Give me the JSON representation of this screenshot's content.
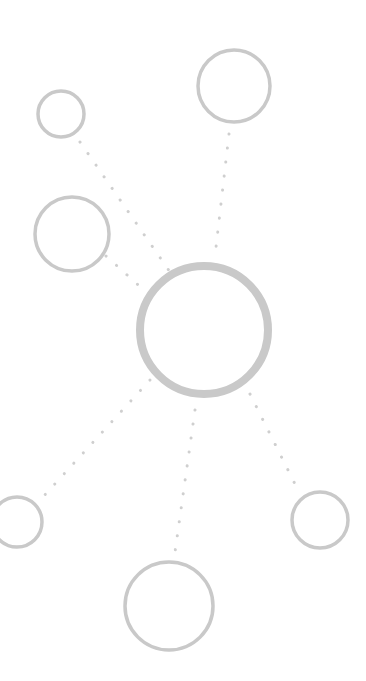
{
  "diagram": {
    "type": "hub-and-spoke network",
    "stroke_color": "#c9c9c9",
    "dot_color": "#cfcfcf",
    "hub": {
      "id": "hub",
      "cx": 204,
      "cy": 330,
      "r": 64,
      "stroke_width": 8
    },
    "nodes": [
      {
        "id": "node-top-right",
        "cx": 234,
        "cy": 86,
        "r": 36,
        "stroke_width": 3.5
      },
      {
        "id": "node-top-left-small",
        "cx": 61,
        "cy": 114,
        "r": 23,
        "stroke_width": 3.5
      },
      {
        "id": "node-left-middle",
        "cx": 72,
        "cy": 234,
        "r": 37,
        "stroke_width": 3.5
      },
      {
        "id": "node-bottom-left",
        "cx": 17,
        "cy": 522,
        "r": 25,
        "stroke_width": 3.5
      },
      {
        "id": "node-bottom-right",
        "cx": 320,
        "cy": 520,
        "r": 28,
        "stroke_width": 3.5
      },
      {
        "id": "node-bottom",
        "cx": 169,
        "cy": 606,
        "r": 44,
        "stroke_width": 3.5
      }
    ],
    "connectors": [
      {
        "id": "link-top-right",
        "x1": 229,
        "y1": 134,
        "x2": 215,
        "y2": 256
      },
      {
        "id": "link-top-left-small",
        "x1": 80,
        "y1": 142,
        "x2": 170,
        "y2": 272
      },
      {
        "id": "link-left-middle",
        "x1": 106,
        "y1": 256,
        "x2": 146,
        "y2": 292
      },
      {
        "id": "link-bottom-left",
        "x1": 150,
        "y1": 380,
        "x2": 42,
        "y2": 498
      },
      {
        "id": "link-bottom",
        "x1": 195,
        "y1": 410,
        "x2": 175,
        "y2": 552
      },
      {
        "id": "link-bottom-right",
        "x1": 250,
        "y1": 394,
        "x2": 298,
        "y2": 490
      }
    ]
  }
}
